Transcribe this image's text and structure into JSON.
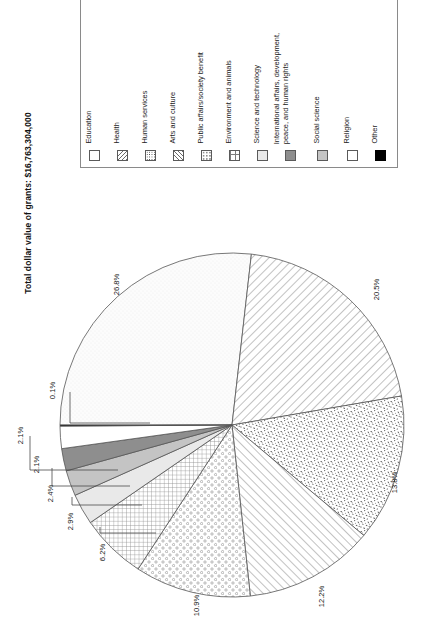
{
  "chart_data": {
    "type": "pie",
    "title": "Total dollar value of grants: $16,763,304,000",
    "xlabel": "",
    "ylabel": "",
    "legend_position": "top-right",
    "grid": false,
    "units": "percent of total grant dollars",
    "total_label": "Total dollar value of grants: $16,763,304,000",
    "total_value": "$16,763,304,000",
    "categories": [
      "Education",
      "Health",
      "Human services",
      "Arts and culture",
      "Public affairs/society benefit",
      "Environment and animals",
      "Science and technology",
      "International affairs, development, peace, and human rights",
      "Social science",
      "Religion",
      "Other"
    ],
    "values": [
      26.8,
      20.5,
      13.8,
      12.2,
      10.9,
      6.2,
      2.9,
      2.4,
      2.1,
      2.1,
      0.1
    ],
    "value_labels": [
      "26.8%",
      "20.5%",
      "13.8%",
      "12.2%",
      "10.9%",
      "6.2%",
      "2.9%",
      "2.4%",
      "2.1%",
      "2.1%",
      "0.1%"
    ],
    "slices": [
      {
        "label": "Education",
        "value": 26.8,
        "value_label": "26.8%",
        "pattern": "fine-stipple-light",
        "color": "#fbfbfb"
      },
      {
        "label": "Health",
        "value": 20.5,
        "value_label": "20.5%",
        "pattern": "diagonal-hatch-back",
        "color": "#ffffff"
      },
      {
        "label": "Human services",
        "value": 13.8,
        "value_label": "13.8%",
        "pattern": "dense-speckle",
        "color": "#ffffff"
      },
      {
        "label": "Arts and culture",
        "value": 12.2,
        "value_label": "12.2%",
        "pattern": "diagonal-hatch-forward",
        "color": "#ffffff"
      },
      {
        "label": "Public affairs/society benefit",
        "value": 10.9,
        "value_label": "10.9%",
        "pattern": "open-circles",
        "color": "#ffffff"
      },
      {
        "label": "Environment and animals",
        "value": 6.2,
        "value_label": "6.2%",
        "pattern": "cross-grid",
        "color": "#ffffff"
      },
      {
        "label": "Science and technology",
        "value": 2.9,
        "value_label": "2.9%",
        "pattern": "solid-light-gray",
        "color": "#e9e9e9"
      },
      {
        "label": "International affairs, development, peace, and human rights",
        "value": 2.4,
        "value_label": "2.4%",
        "pattern": "solid-mid-gray",
        "color": "#c4c4c4"
      },
      {
        "label": "Social science",
        "value": 2.1,
        "value_label": "2.1%",
        "pattern": "solid-dark-gray",
        "color": "#8e8e8e"
      },
      {
        "label": "Religion",
        "value": 2.1,
        "value_label": "2.1%",
        "pattern": "solid-white",
        "color": "#ffffff"
      },
      {
        "label": "Other",
        "value": 0.1,
        "value_label": "0.1%",
        "pattern": "solid-black",
        "color": "#000000"
      }
    ]
  },
  "title": {
    "text": "Total dollar value of grants: $16,763,304,000"
  },
  "legend": {
    "items": [
      {
        "label": "Education",
        "swatch": "blank-swatch"
      },
      {
        "label": "Health",
        "swatch": "diagonal-hatch-back-swatch"
      },
      {
        "label": "Human services",
        "swatch": "dense-speckle-swatch"
      },
      {
        "label": "Arts and culture",
        "swatch": "diagonal-hatch-forward-swatch"
      },
      {
        "label": "Public affairs/society benefit",
        "swatch": "open-circles-swatch"
      },
      {
        "label": "Environment and animals",
        "swatch": "cross-grid-swatch"
      },
      {
        "label": "Science and technology",
        "swatch": "light-gray-swatch"
      },
      {
        "label": "International affairs, development,\npeace, and human rights",
        "swatch": "dark-gray-swatch"
      },
      {
        "label": "Social science",
        "swatch": "mid-gray-swatch"
      },
      {
        "label": "Religion",
        "swatch": "white-swatch"
      },
      {
        "label": "Other",
        "swatch": "black-swatch"
      }
    ]
  },
  "pie_labels": [
    {
      "text": "26.8%"
    },
    {
      "text": "20.5%"
    },
    {
      "text": "13.8%"
    },
    {
      "text": "12.2%"
    },
    {
      "text": "10.9%"
    },
    {
      "text": "6.2%"
    },
    {
      "text": "2.9%"
    },
    {
      "text": "2.4%"
    },
    {
      "text": "2.1%"
    },
    {
      "text": "2.1%"
    },
    {
      "text": "0.1%"
    }
  ],
  "colors": {
    "stroke": "#555555",
    "text": "#161616",
    "legend_border": "#8a8a8a",
    "background": "#ffffff"
  }
}
